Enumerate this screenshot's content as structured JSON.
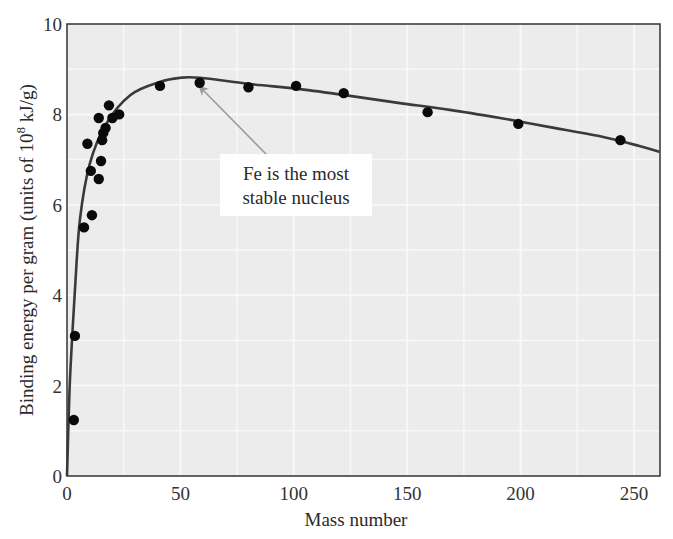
{
  "chart_data": {
    "type": "scatter",
    "title": "",
    "xlabel": "Mass number",
    "ylabel": "Binding energy per gram (units of 10^8 kJ/g)",
    "ylabel_parts": {
      "main": "Binding energy per gram (units of 10",
      "sup": "8",
      "tail": " kJ/g)"
    },
    "xlim": [
      0,
      260
    ],
    "ylim": [
      0,
      10
    ],
    "x_ticks": [
      0,
      50,
      100,
      150,
      200,
      250
    ],
    "y_ticks": [
      0,
      2,
      4,
      6,
      8,
      10
    ],
    "x_tick_labels": [
      "0",
      "50",
      "100",
      "150",
      "200",
      "250"
    ],
    "y_tick_labels": [
      "0",
      "2",
      "4",
      "6",
      "8",
      "10"
    ],
    "grid": true,
    "legend": null,
    "series": [
      {
        "name": "Measured nuclei",
        "kind": "scatter",
        "points": [
          {
            "x": 3,
            "y": 1.24
          },
          {
            "x": 3.5,
            "y": 3.1
          },
          {
            "x": 7.5,
            "y": 5.5
          },
          {
            "x": 11,
            "y": 5.77
          },
          {
            "x": 14,
            "y": 6.57
          },
          {
            "x": 10.5,
            "y": 6.75
          },
          {
            "x": 15,
            "y": 6.97
          },
          {
            "x": 9,
            "y": 7.35
          },
          {
            "x": 15.5,
            "y": 7.43
          },
          {
            "x": 16,
            "y": 7.59
          },
          {
            "x": 17,
            "y": 7.7
          },
          {
            "x": 14,
            "y": 7.92
          },
          {
            "x": 20,
            "y": 7.92
          },
          {
            "x": 23,
            "y": 8.0
          },
          {
            "x": 18.5,
            "y": 8.2
          },
          {
            "x": 41,
            "y": 8.63
          },
          {
            "x": 58.5,
            "y": 8.7
          },
          {
            "x": 80,
            "y": 8.6
          },
          {
            "x": 101,
            "y": 8.63
          },
          {
            "x": 122,
            "y": 8.47
          },
          {
            "x": 159,
            "y": 8.05
          },
          {
            "x": 199,
            "y": 7.79
          },
          {
            "x": 244,
            "y": 7.43
          }
        ]
      },
      {
        "name": "Trend curve",
        "kind": "line",
        "points": [
          {
            "x": 0,
            "y": 0
          },
          {
            "x": 1.3,
            "y": 2.1
          },
          {
            "x": 3.5,
            "y": 4.1
          },
          {
            "x": 5.7,
            "y": 5.67
          },
          {
            "x": 10,
            "y": 6.9
          },
          {
            "x": 17,
            "y": 7.77
          },
          {
            "x": 28,
            "y": 8.43
          },
          {
            "x": 41,
            "y": 8.72
          },
          {
            "x": 50,
            "y": 8.81
          },
          {
            "x": 58.6,
            "y": 8.81
          },
          {
            "x": 80.7,
            "y": 8.67
          },
          {
            "x": 102.7,
            "y": 8.56
          },
          {
            "x": 124.8,
            "y": 8.41
          },
          {
            "x": 146.8,
            "y": 8.25
          },
          {
            "x": 168.8,
            "y": 8.1
          },
          {
            "x": 190.9,
            "y": 7.92
          },
          {
            "x": 212.9,
            "y": 7.72
          },
          {
            "x": 234.6,
            "y": 7.52
          },
          {
            "x": 252.4,
            "y": 7.3
          },
          {
            "x": 261.2,
            "y": 7.17
          }
        ]
      }
    ],
    "annotations": [
      {
        "text_lines": [
          "Fe is the most",
          "stable nucleus"
        ],
        "points_to": {
          "x": 58.6,
          "y": 8.7
        }
      }
    ]
  },
  "colors": {
    "plot_background": "#ececec",
    "grid": "#f8f8f8",
    "axis": "#333333",
    "curve": "#3a3a3a",
    "points": "#0a0a0a",
    "arrow": "#9a9a9a",
    "annotation_box": "#ffffff"
  }
}
